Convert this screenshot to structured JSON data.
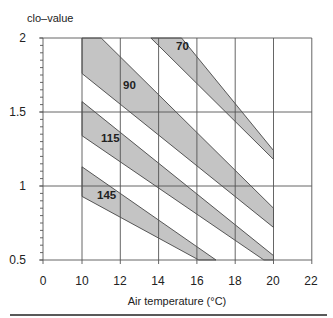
{
  "chart_data": {
    "type": "area",
    "title": "",
    "xlabel": "Air temperature (°C)",
    "ylabel": "clo–value",
    "x_ticks": [
      "0",
      "10",
      "12",
      "14",
      "16",
      "18",
      "20",
      "22"
    ],
    "y_ticks": [
      "0.5",
      "1",
      "1.5",
      "2"
    ],
    "xlim": [
      0,
      22
    ],
    "x_axis_break": "0 to 10 compressed",
    "ylim": [
      0.5,
      2
    ],
    "grid": true,
    "legend": "none (bands labelled inline)",
    "series": [
      {
        "name": "70",
        "polygon": [
          [
            13.6,
            2.0
          ],
          [
            15.2,
            2.0
          ],
          [
            20.0,
            1.24
          ],
          [
            20.0,
            1.18
          ]
        ]
      },
      {
        "name": "90",
        "polygon": [
          [
            10.0,
            2.0
          ],
          [
            11.0,
            2.0
          ],
          [
            20.0,
            0.85
          ],
          [
            20.0,
            0.72
          ],
          [
            10.0,
            1.76
          ]
        ]
      },
      {
        "name": "115",
        "polygon": [
          [
            10.0,
            1.57
          ],
          [
            20.0,
            0.53
          ],
          [
            20.0,
            0.5
          ],
          [
            19.5,
            0.5
          ],
          [
            10.0,
            1.34
          ]
        ]
      },
      {
        "name": "145",
        "polygon": [
          [
            10.0,
            1.13
          ],
          [
            17.0,
            0.5
          ],
          [
            16.1,
            0.5
          ],
          [
            10.0,
            0.93
          ]
        ]
      }
    ]
  },
  "labels": {
    "ylabel": "clo–value",
    "xlabel": "Air temperature (°C)",
    "x_ticks": [
      "0",
      "10",
      "12",
      "14",
      "16",
      "18",
      "20",
      "22"
    ],
    "y_ticks": [
      "0.5",
      "1",
      "1.5",
      "2"
    ],
    "bands": [
      "70",
      "90",
      "115",
      "145"
    ]
  }
}
